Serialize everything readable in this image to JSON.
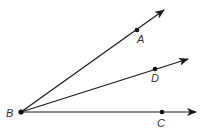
{
  "diagram": {
    "vertex": {
      "label": "B",
      "x": 21,
      "y": 112
    },
    "rays": [
      {
        "name": "BA",
        "point_label": "A",
        "point": {
          "x": 137,
          "y": 30
        },
        "tip": {
          "x": 164,
          "y": 10
        },
        "label_pos": {
          "x": 137,
          "y": 43
        }
      },
      {
        "name": "BD",
        "point_label": "D",
        "point": {
          "x": 155,
          "y": 68
        },
        "tip": {
          "x": 188,
          "y": 59
        },
        "label_pos": {
          "x": 151,
          "y": 82
        }
      },
      {
        "name": "BC",
        "point_label": "C",
        "point": {
          "x": 162,
          "y": 112
        },
        "tip": {
          "x": 196,
          "y": 112
        },
        "label_pos": {
          "x": 157,
          "y": 127
        }
      }
    ],
    "vertex_label_pos": {
      "x": 6,
      "y": 117
    },
    "colors": {
      "stroke": "#1a1a1a",
      "label": "#333333",
      "background": "#ffffff"
    }
  }
}
